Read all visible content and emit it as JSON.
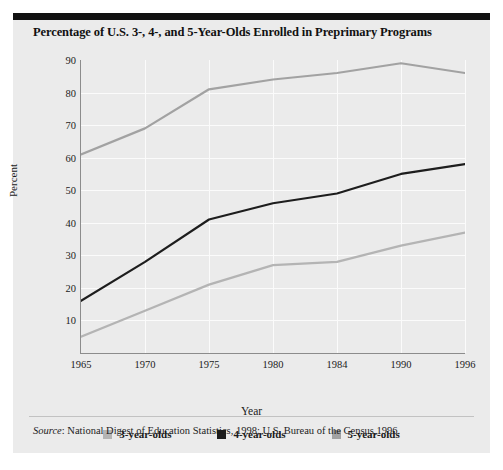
{
  "figure": {
    "title": "Percentage of U.S. 3-, 4-, and 5-Year-Olds Enrolled in Preprimary Programs",
    "source_prefix": "Source",
    "source_text": ": National Digest of Education Statistics, 1998; U.S. Bureau of the Census,1996."
  },
  "chart_data": {
    "type": "line",
    "title": "Percentage of U.S. 3-, 4-, and 5-Year-Olds Enrolled in Preprimary Programs",
    "xlabel": "Year",
    "ylabel": "Percent",
    "categories": [
      "1965",
      "1970",
      "1975",
      "1980",
      "1984",
      "1990",
      "1996"
    ],
    "ylim": [
      0,
      90
    ],
    "yticks": [
      10,
      20,
      30,
      40,
      50,
      60,
      70,
      80,
      90
    ],
    "grid": true,
    "legend_position": "bottom",
    "series": [
      {
        "name": "3-year-olds",
        "color": "#b4b4b4",
        "values": [
          5,
          13,
          21,
          27,
          28,
          33,
          37
        ]
      },
      {
        "name": "4-year-olds",
        "color": "#1d1d1d",
        "values": [
          16,
          28,
          41,
          46,
          49,
          55,
          58
        ]
      },
      {
        "name": "5-year-olds",
        "color": "#a2a2a2",
        "values": [
          61,
          69,
          81,
          84,
          86,
          89,
          86
        ]
      }
    ]
  }
}
